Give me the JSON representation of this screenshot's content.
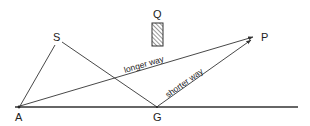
{
  "diagram": {
    "points": {
      "A": {
        "label": "A",
        "x": 19,
        "y": 107
      },
      "S": {
        "label": "S",
        "x": 57,
        "y": 44
      },
      "G": {
        "label": "G",
        "x": 157,
        "y": 107
      },
      "P": {
        "label": "P",
        "x": 255,
        "y": 36
      },
      "Q": {
        "label": "Q"
      }
    },
    "obstacle": {
      "label": "Q",
      "x": 152,
      "y": 23,
      "width": 11,
      "height": 23,
      "fill": "hatched"
    },
    "ground_line": {
      "x1": 15,
      "x2": 298,
      "y": 107
    },
    "paths": {
      "longer": {
        "label": "longer way",
        "from": "A",
        "to": "P"
      },
      "shorter": {
        "label": "shorter way",
        "from": "G",
        "to": "P"
      }
    },
    "colors": {
      "line": "#333333",
      "background": "#ffffff"
    }
  }
}
